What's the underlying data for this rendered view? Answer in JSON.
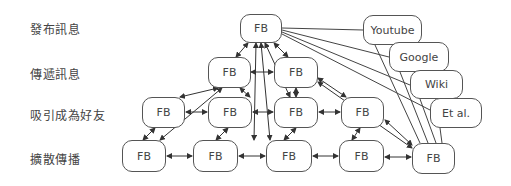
{
  "rows": [
    {
      "label": "發布訊息"
    },
    {
      "label": "傳遞訊息"
    },
    {
      "label": "吸引成為好友"
    },
    {
      "label": "擴散傳播"
    }
  ],
  "nodes": {
    "top": "FB",
    "r2a": "FB",
    "r2b": "FB",
    "r3a": "FB",
    "r3b": "FB",
    "r3c": "FB",
    "r3d": "FB",
    "r4a": "FB",
    "r4b": "FB",
    "r4c": "FB",
    "r4d": "FB",
    "r4e": "FB"
  },
  "sources": {
    "youtube": "Youtube",
    "google": "Google",
    "wiki": "Wiki",
    "etal": "Et al."
  }
}
